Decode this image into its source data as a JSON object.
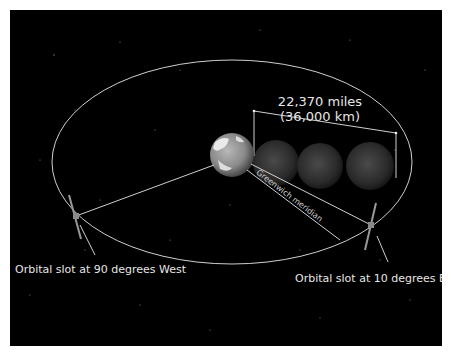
{
  "diagram": {
    "distance_label_line1": "22,370 miles",
    "distance_label_line2": "(36,000 km)",
    "meridian_label": "Greenwich meridian",
    "slot_west_label": "Orbital slot at 90 degrees West",
    "slot_east_label": "Orbital slot at 10 degrees East",
    "colors": {
      "background": "#000000",
      "orbit_line": "#cfcfcf",
      "text": "#e6e6e6",
      "border": "#ffffff"
    }
  }
}
